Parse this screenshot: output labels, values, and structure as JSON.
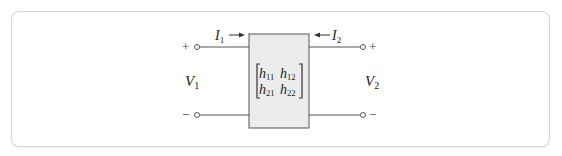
{
  "diagram": {
    "port1": {
      "current": {
        "symbol": "I",
        "subscript": "1",
        "direction": "into-network"
      },
      "voltage": {
        "symbol": "V",
        "subscript": "1"
      },
      "plus_sign": "+",
      "minus_sign": "−"
    },
    "port2": {
      "current": {
        "symbol": "I",
        "subscript": "2",
        "direction": "into-network"
      },
      "voltage": {
        "symbol": "V",
        "subscript": "2"
      },
      "plus_sign": "+",
      "minus_sign": "−"
    },
    "matrix": {
      "symbol": "h",
      "entries": [
        [
          "11",
          "12"
        ],
        [
          "21",
          "22"
        ]
      ]
    },
    "colors": {
      "box_fill": "#ececec",
      "line": "#555555",
      "card_border": "#d4d4d4"
    }
  }
}
